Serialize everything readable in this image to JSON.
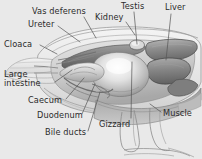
{
  "figure": {
    "background_color": "#e9e9e9",
    "label_color": "#2b2b2b",
    "leader_line_color": "#555555",
    "title": ""
  },
  "labels": [
    {
      "id": "vas-deferens",
      "text": "Vas deferens",
      "x": 32,
      "y": 7,
      "align": "left"
    },
    {
      "id": "ureter",
      "text": "Ureter",
      "x": 28,
      "y": 20,
      "align": "left"
    },
    {
      "id": "cloaca",
      "text": "Cloaca",
      "x": 4,
      "y": 40,
      "align": "left"
    },
    {
      "id": "large-intestine",
      "text": "Large\nintestine",
      "x": 4,
      "y": 70,
      "align": "left"
    },
    {
      "id": "caecum",
      "text": "Caecum",
      "x": 28,
      "y": 96,
      "align": "left"
    },
    {
      "id": "duodenum",
      "text": "Duodenum",
      "x": 37,
      "y": 111,
      "align": "left"
    },
    {
      "id": "bile-ducts",
      "text": "Bile ducts",
      "x": 45,
      "y": 128,
      "align": "left"
    },
    {
      "id": "gizzard",
      "text": "Gizzard",
      "x": 99,
      "y": 120,
      "align": "left"
    },
    {
      "id": "testis",
      "text": "Testis",
      "x": 121,
      "y": 2,
      "align": "left"
    },
    {
      "id": "kidney",
      "text": "Kidney",
      "x": 95,
      "y": 13,
      "align": "left"
    },
    {
      "id": "liver",
      "text": "Liver",
      "x": 165,
      "y": 3,
      "align": "left"
    },
    {
      "id": "muscle",
      "text": "Muscle",
      "x": 163,
      "y": 109,
      "align": "left"
    }
  ],
  "leader_lines": [
    {
      "id": "leader-vas-deferens",
      "points": "84,17 96,38"
    },
    {
      "id": "leader-ureter",
      "points": "58,26 80,42"
    },
    {
      "id": "leader-cloaca",
      "points": "40,45 57,54"
    },
    {
      "id": "leader-large-intestine",
      "points": "55,82 72,70"
    },
    {
      "id": "leader-caecum",
      "points": "66,99 84,78"
    },
    {
      "id": "leader-duodenum",
      "points": "82,114 95,84"
    },
    {
      "id": "leader-bile-ducts",
      "points": "88,131 100,92"
    },
    {
      "id": "leader-gizzard",
      "points": "131,118 132,62"
    },
    {
      "id": "leader-testis",
      "points": "134,12 137,44"
    },
    {
      "id": "leader-kidney",
      "points": "126,22 135,35"
    },
    {
      "id": "leader-liver",
      "points": "171,14 166,60"
    },
    {
      "id": "leader-muscle",
      "points": "161,112 150,104"
    }
  ],
  "organs": [
    {
      "id": "body-outline",
      "name": "bird-body-outline"
    },
    {
      "id": "liver-lobe",
      "name": "liver-organ"
    },
    {
      "id": "gizzard-organ",
      "name": "gizzard-organ"
    },
    {
      "id": "kidney-organ",
      "name": "kidney-organ"
    },
    {
      "id": "testis-organ",
      "name": "testis-organ"
    },
    {
      "id": "intestine-coil",
      "name": "intestine-coil"
    },
    {
      "id": "leg-muscle",
      "name": "leg-and-muscle"
    }
  ]
}
